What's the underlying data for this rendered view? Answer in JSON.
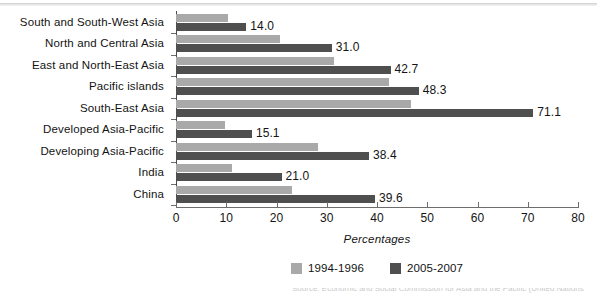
{
  "chart_data": {
    "type": "bar",
    "orientation": "horizontal",
    "title": "",
    "xlabel": "Percentages",
    "ylabel": "",
    "xlim": [
      0,
      80
    ],
    "xticks": [
      0,
      10,
      20,
      30,
      40,
      50,
      60,
      70,
      80
    ],
    "grid": false,
    "legend_position": "bottom-center",
    "categories": [
      "South  and  South-West  Asia",
      "North  and  Central  Asia",
      "East  and  North-East  Asia",
      "Pacific  islands",
      "South-East  Asia",
      "Developed  Asia-Pacific",
      "Developing  Asia-Pacific",
      "India",
      "China"
    ],
    "series": [
      {
        "name": "1994-1996",
        "color": "#a9a9a9",
        "values": [
          10.3,
          20.7,
          31.4,
          42.4,
          46.8,
          9.8,
          28.3,
          11.1,
          23.1
        ],
        "labels": [
          "",
          "",
          "",
          "",
          "",
          "",
          "",
          "",
          ""
        ]
      },
      {
        "name": "2005-2007",
        "color": "#4f4f4f",
        "values": [
          14.0,
          31.0,
          42.7,
          48.3,
          71.1,
          15.1,
          38.4,
          21.0,
          39.6
        ],
        "labels": [
          "14.0",
          "31.0",
          "42.7",
          "48.3",
          "71.1",
          "15.1",
          "38.4",
          "21.0",
          "39.6"
        ]
      }
    ]
  },
  "legend": {
    "items": [
      {
        "label": "1994-1996",
        "swatch": "prev"
      },
      {
        "label": "2005-2007",
        "swatch": "curr"
      }
    ]
  },
  "axis": {
    "x_title": "Percentages"
  },
  "source_note": {
    "text": "Source: Economic and Social Commission for Asia and the Pacific (United Nations"
  }
}
